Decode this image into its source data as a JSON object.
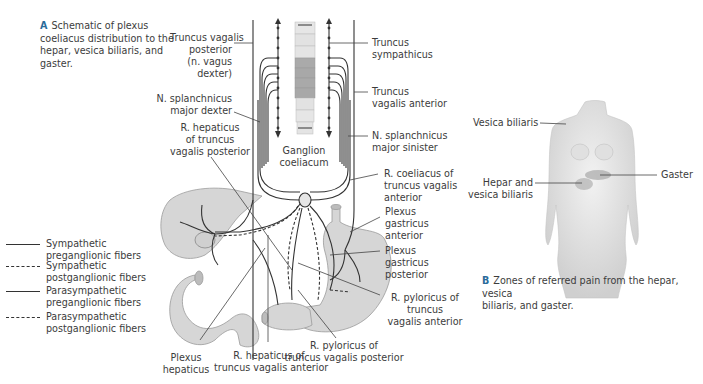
{
  "figure_a": {
    "caption_letter": "A",
    "caption_line1": "Schematic of plexus",
    "caption_line2": "coeliacus distribution to the",
    "caption_line3": "hepar, vesica biliaris, and",
    "caption_line4": "gaster.",
    "labels": {
      "truncus_vagalis_posterior": [
        "Truncus vagalis",
        "posterior",
        "(n. vagus",
        "dexter)"
      ],
      "n_splanchnicus_major_dexter": [
        "N. splanchnicus",
        "major dexter"
      ],
      "r_hepaticus_posterior": [
        "R. hepaticus",
        "of truncus",
        "vagalis posterior"
      ],
      "ganglion_coeliacum": [
        "Ganglion",
        "coeliacum"
      ],
      "truncus_sympathicus": [
        "Truncus",
        "sympathicus"
      ],
      "truncus_vagalis_anterior": [
        "Truncus",
        "vagalis anterior"
      ],
      "n_splanchnicus_major_sinister": [
        "N. splanchnicus",
        "major sinister"
      ],
      "r_coeliacus_anterior": [
        "R. coeliacus of",
        "truncus vagalis",
        "anterior"
      ],
      "plexus_gastricus_anterior": [
        "Plexus",
        "gastricus",
        "anterior"
      ],
      "plexus_gastricus_posterior": [
        "Plexus",
        "gastricus",
        "posterior"
      ],
      "r_pyloricus_anterior": [
        "R. pyloricus of",
        "truncus",
        "vagalis anterior"
      ],
      "r_pyloricus_posterior": [
        "R. pyloricus of",
        "truncus vagalis posterior"
      ],
      "r_hepaticus_anterior": [
        "R. hepaticus of",
        "truncus vagalis anterior"
      ],
      "plexus_hepaticus": [
        "Plexus",
        "hepaticus"
      ]
    },
    "legend": [
      {
        "style": "solid",
        "line1": "Sympathetic",
        "line2": "preganglionic fibers"
      },
      {
        "style": "dashed",
        "line1": "Sympathetic",
        "line2": "postganglionic fibers"
      },
      {
        "style": "solid",
        "line1": "Parasympathetic",
        "line2": "preganglionic fibers"
      },
      {
        "style": "dashed",
        "line1": "Parasympathetic",
        "line2": "postganglionic fibers"
      }
    ]
  },
  "figure_b": {
    "caption_letter": "B",
    "caption_line1": "Zones of referred pain from the hepar, vesica",
    "caption_line2": "biliaris, and gaster.",
    "labels": {
      "vesica_biliaris": "Vesica biliaris",
      "hepar_vesica": [
        "Hepar and",
        "vesica biliaris"
      ],
      "gaster": "Gaster"
    }
  },
  "colors": {
    "organ_fill": "#d6d6d6",
    "line": "#333333",
    "caption_letter": "#2a6b9a",
    "spine_light": "#e4e4e4",
    "spine_dark": "#a9a9a9"
  }
}
